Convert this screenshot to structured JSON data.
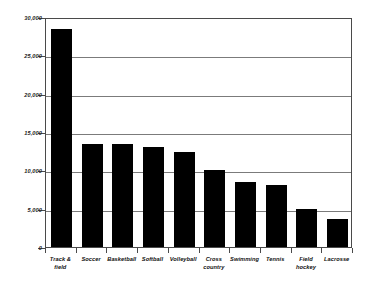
{
  "chart_data": {
    "type": "bar",
    "title": "",
    "subtitle": "",
    "xlabel": "",
    "ylabel": "",
    "ylim": [
      0,
      30000
    ],
    "ytick_step": 5000,
    "grid": true,
    "legend": "none",
    "orientation": "vertical",
    "bar_color": "#000000",
    "axis_color": "#4a4a4a",
    "grid_color": "#7b7b7b",
    "categories": [
      "Track & field",
      "Soccer",
      "Basketball",
      "Softball",
      "Volleyball",
      "Cross country",
      "Swimming",
      "Tennis",
      "Field hockey",
      "Lacrosse"
    ],
    "category_lines": [
      [
        "Track &",
        "field"
      ],
      [
        "Soccer"
      ],
      [
        "Basketball"
      ],
      [
        "Softball"
      ],
      [
        "Volleyball"
      ],
      [
        "Cross",
        "country"
      ],
      [
        "Swimming"
      ],
      [
        "Tennis"
      ],
      [
        "Field",
        "hockey"
      ],
      [
        "Lacrosse"
      ]
    ],
    "values": [
      28400,
      13500,
      13500,
      13000,
      12400,
      10000,
      8500,
      8100,
      5000,
      3600
    ],
    "yticks": [
      0,
      5000,
      10000,
      15000,
      20000,
      25000,
      30000
    ],
    "ytick_labels": [
      "0",
      "5,000",
      "10,000",
      "15,000",
      "20,000",
      "25,000",
      "30,000"
    ]
  }
}
